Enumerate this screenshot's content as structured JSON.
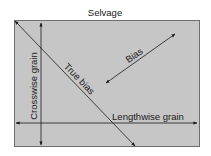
{
  "diagram": {
    "title": "Selvage",
    "labels": {
      "crosswise": "Crosswise grain",
      "true_bias": "True bias",
      "bias": "Bias",
      "lengthwise": "Lengthwise grain"
    },
    "colors": {
      "fabric_fill": "#c6c6c6",
      "fabric_border": "#6e6e6e",
      "line": "#1a1a1a"
    }
  }
}
